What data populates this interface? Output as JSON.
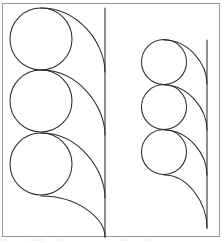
{
  "figure": {
    "name": "tangent-circles-figure",
    "canvas": {
      "width": 224,
      "height": 243,
      "background": "#ffffff"
    },
    "frame": {
      "label": "figure border",
      "x": 2.5,
      "y": 3.5,
      "width": 217,
      "height": 233,
      "stroke": "#9a9a9a",
      "stroke_width": 1
    },
    "stroke_color": "#2b2b2b",
    "stroke_width": 1.05,
    "groups": [
      {
        "name": "left-group",
        "label": "Large chain of three tangent circles",
        "circle_radius": 31,
        "circle_count": 3,
        "circles": [
          {
            "label": "left-circle-1",
            "cx": 41,
            "cy": 39,
            "r": 31
          },
          {
            "label": "left-circle-2",
            "cx": 41,
            "cy": 101,
            "r": 31
          },
          {
            "label": "left-circle-3",
            "cx": 41,
            "cy": 164,
            "r": 31
          }
        ],
        "axis_line": {
          "label": "left-vertical-line",
          "x": 105,
          "y_top": 8,
          "y_bottom": 237
        },
        "arcs": [
          {
            "label": "left-arc-1",
            "start_x": 41,
            "start_y": 8,
            "end_x": 105,
            "end_y": 72
          },
          {
            "label": "left-arc-2",
            "start_x": 41,
            "start_y": 70,
            "end_x": 105,
            "end_y": 135
          },
          {
            "label": "left-arc-3",
            "start_x": 41,
            "start_y": 133,
            "end_x": 105,
            "end_y": 198
          },
          {
            "label": "left-arc-4",
            "start_x": 41,
            "start_y": 196,
            "end_x": 105,
            "end_y": 237
          }
        ]
      },
      {
        "name": "right-group",
        "label": "Small chain of three tangent circles",
        "circle_radius": 22.5,
        "circle_count": 3,
        "circles": [
          {
            "label": "right-circle-1",
            "cx": 164,
            "cy": 62,
            "r": 22.5
          },
          {
            "label": "right-circle-2",
            "cx": 164,
            "cy": 107,
            "r": 22.5
          },
          {
            "label": "right-circle-3",
            "cx": 164,
            "cy": 152,
            "r": 22.5
          }
        ],
        "axis_line": {
          "label": "right-vertical-line",
          "x": 207,
          "y_top": 40,
          "y_bottom": 228
        },
        "arcs": [
          {
            "label": "right-arc-1",
            "start_x": 164,
            "start_y": 40,
            "end_x": 207,
            "end_y": 84
          },
          {
            "label": "right-arc-2",
            "start_x": 164,
            "start_y": 85,
            "end_x": 207,
            "end_y": 130
          },
          {
            "label": "right-arc-3",
            "start_x": 164,
            "start_y": 130,
            "end_x": 207,
            "end_y": 175
          },
          {
            "label": "right-arc-4",
            "start_x": 164,
            "start_y": 175,
            "end_x": 207,
            "end_y": 228
          }
        ]
      }
    ],
    "caption_artifact": {
      "label": "cropped caption text remnant below frame",
      "visible_text": "",
      "y": 239
    }
  }
}
